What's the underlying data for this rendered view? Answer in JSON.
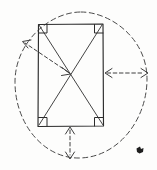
{
  "figure": {
    "canvas": {
      "width": 157,
      "height": 170,
      "background": "#fdfdfc"
    },
    "colors": {
      "solid_ink": "#2b2b2b",
      "diagonal_ink": "#3a3a3a",
      "dashed_ink": "#4a4a4a",
      "arrow_ink": "#3f3f3f",
      "mark_ink": "#1f1f1f"
    },
    "rectangle": {
      "name": "rectangle",
      "left": 38,
      "top": 24,
      "right": 103,
      "bottom": 126,
      "width": 65,
      "height": 102
    },
    "center": {
      "x": 70.5,
      "y": 75
    },
    "ellipse": {
      "name": "circumscribed-ellipse",
      "cx": 81,
      "cy": 85,
      "rx": 66,
      "ry": 73,
      "style": "dashed"
    },
    "diagonals": [
      {
        "name": "diagonal-tl-br",
        "x1": 38,
        "y1": 24,
        "x2": 103,
        "y2": 126
      },
      {
        "name": "diagonal-tr-bl",
        "x1": 103,
        "y1": 24,
        "x2": 38,
        "y2": 126
      }
    ],
    "right_angle_markers": [
      {
        "name": "corner-top-left",
        "x": 38,
        "y": 24
      },
      {
        "name": "corner-top-right",
        "x": 103,
        "y": 24
      },
      {
        "name": "corner-bottom-left",
        "x": 38,
        "y": 126
      },
      {
        "name": "corner-bottom-right",
        "x": 103,
        "y": 126
      }
    ],
    "arrows": [
      {
        "name": "arrow-radius-upper-left",
        "orientation": "diagonal",
        "heads": "both",
        "from": {
          "x": 70,
          "y": 73
        },
        "to": {
          "x": 22,
          "y": 41
        },
        "style": "dashed"
      },
      {
        "name": "arrow-horizontal-right",
        "orientation": "horizontal",
        "heads": "both",
        "from": {
          "x": 104,
          "y": 73
        },
        "to": {
          "x": 147,
          "y": 73
        },
        "style": "dashed"
      },
      {
        "name": "arrow-vertical-down",
        "orientation": "vertical",
        "heads": "both",
        "from": {
          "x": 70,
          "y": 127
        },
        "to": {
          "x": 70,
          "y": 159
        },
        "style": "dashed"
      }
    ],
    "ink_mark": {
      "name": "pen-mark",
      "x": 136,
      "y": 146,
      "width": 8,
      "height": 9
    }
  }
}
